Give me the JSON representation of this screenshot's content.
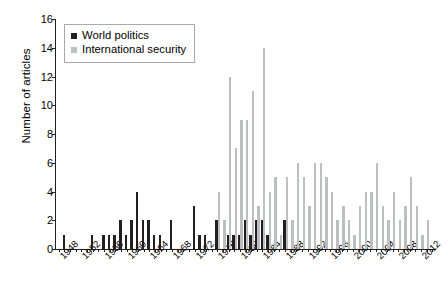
{
  "chart_data": {
    "type": "bar",
    "title": "",
    "xlabel": "",
    "ylabel": "Number of articles",
    "ylim": [
      0,
      16
    ],
    "yticks": [
      0,
      2,
      4,
      6,
      8,
      10,
      12,
      14,
      16
    ],
    "xlim": [
      1948,
      2014
    ],
    "xtick_labels": [
      "1948",
      "1952",
      "1956",
      "1960",
      "1964",
      "1968",
      "1972",
      "1976",
      "1980",
      "1984",
      "1988",
      "1992",
      "1996",
      "2000",
      "2004",
      "2008",
      "2012"
    ],
    "xtick_step": 4,
    "grid": false,
    "legend_position": "top-left",
    "colors": {
      "world_politics": "#231f20",
      "international_security": "#bcbec0",
      "axis": "#231f20"
    },
    "x": [
      1948,
      1949,
      1950,
      1951,
      1952,
      1953,
      1954,
      1955,
      1956,
      1957,
      1958,
      1959,
      1960,
      1961,
      1962,
      1963,
      1964,
      1965,
      1966,
      1967,
      1968,
      1969,
      1970,
      1971,
      1972,
      1973,
      1974,
      1975,
      1976,
      1977,
      1978,
      1979,
      1980,
      1981,
      1982,
      1983,
      1984,
      1985,
      1986,
      1987,
      1988,
      1989,
      1990,
      1991,
      1992,
      1993,
      1994,
      1995,
      1996,
      1997,
      1998,
      1999,
      2000,
      2001,
      2002,
      2003,
      2004,
      2005,
      2006,
      2007,
      2008,
      2009,
      2010,
      2011,
      2012,
      2013
    ],
    "series": [
      {
        "name": "World politics",
        "color": "#231f20",
        "values": [
          0,
          1,
          0,
          0,
          0,
          0,
          1,
          0,
          1,
          1,
          1,
          2,
          1,
          2,
          4,
          2,
          2,
          1,
          1,
          0,
          2,
          0,
          0,
          0,
          3,
          1,
          1,
          0,
          2,
          0,
          1,
          1,
          1,
          2,
          1,
          2,
          2,
          1,
          0,
          0,
          2,
          0,
          0,
          0,
          0,
          0,
          0,
          0,
          0,
          0,
          0,
          0,
          0,
          0,
          0,
          0,
          0,
          0,
          0,
          0,
          0,
          0,
          0,
          0,
          0,
          0
        ]
      },
      {
        "name": "International security",
        "color": "#bcbec0",
        "values": [
          0,
          0,
          0,
          0,
          0,
          0,
          0,
          0,
          0,
          0,
          0,
          0,
          0,
          0,
          0,
          0,
          0,
          0,
          0,
          0,
          0,
          0,
          0,
          0,
          0,
          0,
          0,
          0,
          4,
          2,
          12,
          7,
          9,
          9,
          11,
          3,
          14,
          4,
          5,
          1,
          5,
          2,
          6,
          5,
          3,
          6,
          6,
          5,
          4,
          2,
          3,
          2,
          1,
          3,
          4,
          4,
          6,
          3,
          2,
          4,
          2,
          3,
          5,
          3,
          1,
          2
        ]
      }
    ]
  },
  "legend": {
    "items": [
      {
        "label": "World politics",
        "swatch": "wp"
      },
      {
        "label": "International security",
        "swatch": "is"
      }
    ]
  },
  "axes": {
    "y_title": "Number of articles"
  }
}
